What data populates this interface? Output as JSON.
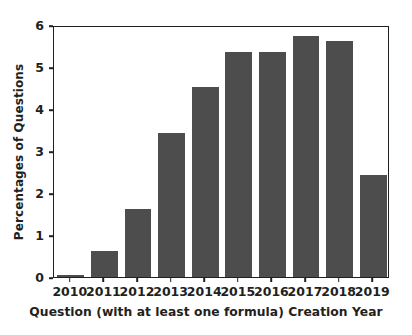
{
  "chart_data": {
    "type": "bar",
    "title": "",
    "subtitle": "",
    "xlabel": "Question (with at least one formula) Creation Year",
    "ylabel": "Percentages of Questions",
    "categories": [
      "2010",
      "2011",
      "2012",
      "2013",
      "2014",
      "2015",
      "2016",
      "2017",
      "2018",
      "2019"
    ],
    "values": [
      0.05,
      0.63,
      1.63,
      3.42,
      4.52,
      5.35,
      5.36,
      5.75,
      5.63,
      2.44
    ],
    "series": [
      {
        "name": "Percentages of Questions",
        "values": [
          0.05,
          0.63,
          1.63,
          3.42,
          4.52,
          5.35,
          5.36,
          5.75,
          5.63,
          2.44
        ]
      }
    ],
    "ylim": [
      0,
      6
    ],
    "yticks": [
      0,
      1,
      2,
      3,
      4,
      5,
      6
    ],
    "ytick_labels": [
      "0",
      "1",
      "2",
      "3",
      "4",
      "5",
      "6"
    ],
    "xtick_labels": [
      "2010",
      "2011",
      "2012",
      "2013",
      "2014",
      "2015",
      "2016",
      "2017",
      "2018",
      "2019"
    ],
    "grid": false,
    "legend": null,
    "legend_position": "none",
    "bar_color": "#4d4d4d",
    "axis_color": "#231f20",
    "background_color": "#ffffff",
    "annotations": []
  }
}
